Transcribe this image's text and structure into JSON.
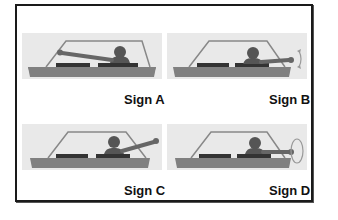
{
  "diagram": {
    "signs": [
      {
        "id": "A",
        "label": "Sign A",
        "arm": "straight-out-left",
        "icon": "arm-extended-out-icon"
      },
      {
        "id": "B",
        "label": "Sign B",
        "arm": "straight-out-with-up-down-motion",
        "icon": "up-down-motion-icon"
      },
      {
        "id": "C",
        "label": "Sign C",
        "arm": "angled-upward",
        "icon": "arm-raised-icon"
      },
      {
        "id": "D",
        "label": "Sign D",
        "arm": "straight-out-with-circular-motion",
        "icon": "circular-motion-icon"
      }
    ],
    "colors": {
      "panel_bg": "#e9e9e9",
      "car_body": "#7a7a7a",
      "driver": "#555555",
      "frame": "#1a1a1a"
    }
  }
}
